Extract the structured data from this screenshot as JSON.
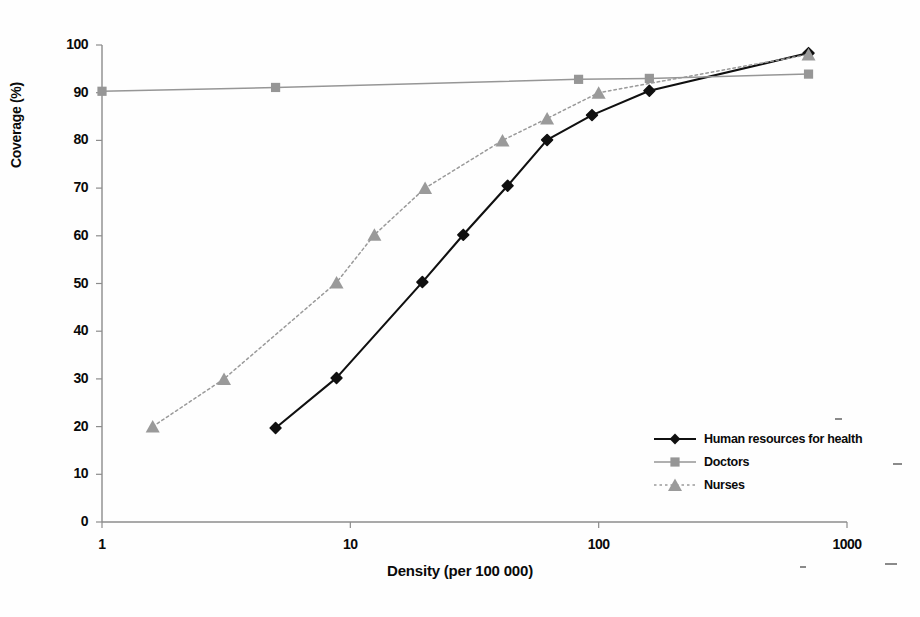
{
  "chart_data": {
    "type": "line",
    "title": "",
    "xlabel": "Density (per 100 000)",
    "ylabel": "Coverage (%)",
    "xscale": "log",
    "xlim": [
      1,
      1000
    ],
    "ylim": [
      0,
      100
    ],
    "xticks": [
      "1",
      "10",
      "100",
      "1000"
    ],
    "xtick_values": [
      1,
      10,
      100,
      1000
    ],
    "yticks": [
      "0",
      "10",
      "20",
      "30",
      "40",
      "50",
      "60",
      "70",
      "80",
      "90",
      "100"
    ],
    "ytick_values": [
      0,
      10,
      20,
      30,
      40,
      50,
      60,
      70,
      80,
      90,
      100
    ],
    "grid": false,
    "legend_position": "lower right",
    "series": [
      {
        "name": "Human resources for health",
        "color": "#101010",
        "marker": "diamond",
        "linestyle": "solid",
        "x": [
          5.0,
          8.8,
          19.5,
          28.5,
          43.0,
          62.0,
          94.0,
          160.0,
          700.0
        ],
        "y": [
          19.7,
          30.2,
          50.3,
          60.2,
          70.5,
          80.1,
          85.3,
          90.4,
          98.3
        ]
      },
      {
        "name": "Doctors",
        "color": "#969696",
        "marker": "square",
        "linestyle": "solid",
        "x": [
          1.0,
          5.0,
          83.0,
          160.0,
          700.0
        ],
        "y": [
          90.3,
          91.1,
          92.8,
          93.0,
          93.9
        ]
      },
      {
        "name": "Nurses",
        "color": "#9a9a9a",
        "marker": "triangle",
        "linestyle": "dotted",
        "x": [
          1.6,
          3.1,
          8.8,
          12.5,
          20.0,
          41.0,
          62.0,
          100.0,
          700.0
        ],
        "y": [
          20.0,
          30.0,
          50.2,
          60.2,
          70.0,
          80.0,
          84.6,
          90.0,
          98.0
        ]
      }
    ]
  },
  "legend": {
    "items": [
      {
        "label": "Human resources for health",
        "color": "#101010",
        "marker": "diamond",
        "linestyle": "solid"
      },
      {
        "label": "Doctors",
        "color": "#969696",
        "marker": "square",
        "linestyle": "solid"
      },
      {
        "label": "Nurses",
        "color": "#9a9a9a",
        "marker": "triangle",
        "linestyle": "dotted"
      }
    ]
  },
  "axes": {
    "x_title": "Density (per 100 000)",
    "y_title": "Coverage (%)"
  },
  "colors": {
    "axis": "#8c8c8c",
    "series_primary": "#101010",
    "series_secondary": "#969696",
    "background": "#ffffff"
  }
}
